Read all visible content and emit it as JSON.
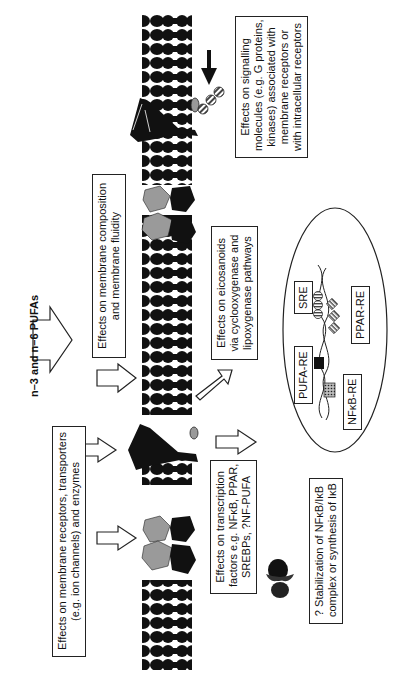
{
  "title": "n–3 and n–6 PUFAs",
  "boxes": {
    "signalling": [
      "Effects on signalling",
      "molecules (e.g. G proteins,",
      "kinases) associated with",
      "membrane receptors or",
      "with intracellular receptors"
    ],
    "membrane_composition": [
      "Effects on membrane composition",
      "and membrane fluidity"
    ],
    "eicosanoids": [
      "Effects on eicosanoids",
      "via cyclooxygenase and",
      "lipoxygenase pathways"
    ],
    "receptors": [
      "Effects on membrane receptors, transporters",
      "(e.g. ion channels) and enzymes"
    ],
    "transcription": [
      "Effects on transcription",
      "factors e.g. NFκB, PPAR,",
      "SREBPs, ?NF-PUFA"
    ],
    "stabilization": [
      "? Stabilization of NFκB/IκB",
      "complex or synthesis of IκB"
    ]
  },
  "dna_elements": {
    "sre": "SRE",
    "ppar_re": "PPAR-RE",
    "pufa_re": "PUFA-RE",
    "nfkb_re": "NFκB-RE"
  },
  "colors": {
    "membrane": "#111111",
    "protein_gray": "#9a9a9a",
    "protein_black": "#111111",
    "outline": "#222222"
  }
}
